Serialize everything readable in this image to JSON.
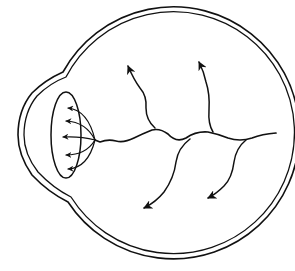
{
  "diagram": {
    "type": "eye-cross-section",
    "description": "Line drawing of an eyeball cross-section showing the retinal blood vessels branching from the optic disc and rays converging toward the lens",
    "colors": {
      "background": "#ffffff",
      "line": "#111111"
    },
    "parts": [
      {
        "id": "globe",
        "name": "Eyeball (sclera, double outline)"
      },
      {
        "id": "cornea",
        "name": "Corneal bulge"
      },
      {
        "id": "lens",
        "name": "Lens"
      },
      {
        "id": "optic-disc",
        "name": "Optic disc"
      },
      {
        "id": "vessels",
        "name": "Retinal vessels with arrowheads (5 branches)"
      },
      {
        "id": "lens-rays",
        "name": "Rays into lens with arrowheads (5)"
      }
    ],
    "vessel_arrow_count": 5,
    "lens_arrow_count": 5
  }
}
